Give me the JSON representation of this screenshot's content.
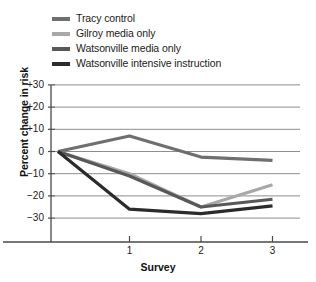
{
  "chart_data": {
    "type": "line",
    "title": "",
    "xlabel": "Survey",
    "ylabel": "Percent change in risk",
    "x": [
      0,
      1,
      2,
      3
    ],
    "xtick_labels": [
      "1",
      "2",
      "3"
    ],
    "xtick_values": [
      1,
      2,
      3
    ],
    "ytick_labels": [
      "+30",
      "+20",
      "+10",
      "0",
      "−10",
      "−20",
      "−30"
    ],
    "ytick_values": [
      30,
      20,
      10,
      0,
      -10,
      -20,
      -30
    ],
    "ylim": [
      -34,
      33
    ],
    "xlim": [
      -0.12,
      3.5
    ],
    "grid": "horizontal",
    "legend_position": "top-left",
    "series": [
      {
        "name": "Tracy control",
        "color": "#6f6f6f",
        "values": [
          0,
          7,
          -2.5,
          -4
        ]
      },
      {
        "name": "Gilroy media only",
        "color": "#a8a8a8",
        "values": [
          0,
          -10,
          -25,
          -15
        ]
      },
      {
        "name": "Watsonville media only",
        "color": "#585858",
        "values": [
          0,
          -11,
          -25,
          -21.5
        ]
      },
      {
        "name": "Watsonville intensive instruction",
        "color": "#2b2b2b",
        "values": [
          0,
          -26,
          -28,
          -24.5
        ]
      }
    ]
  }
}
